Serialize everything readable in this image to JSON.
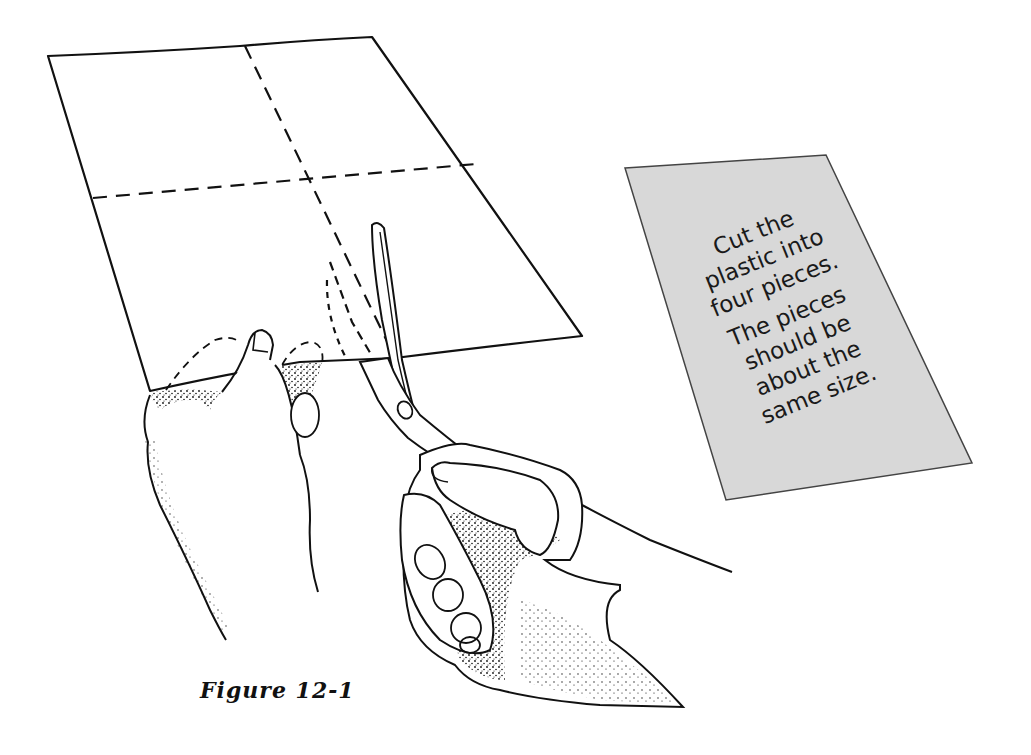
{
  "figure": {
    "caption": "Figure 12-1"
  },
  "instruction_card": {
    "paragraphs": [
      {
        "lines": [
          "Cut the",
          "plastic into",
          "four pieces."
        ]
      },
      {
        "lines": [
          "The pieces",
          "should be",
          "about the",
          "same size."
        ]
      }
    ],
    "fill_color": "#d8d8d8",
    "border_color": "#444444"
  },
  "colors": {
    "background": "#ffffff",
    "ink": "#111111"
  }
}
